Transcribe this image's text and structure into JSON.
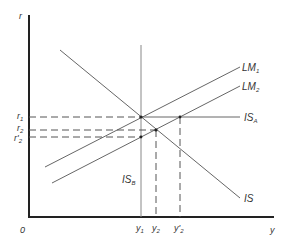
{
  "diagram": {
    "type": "IS-LM",
    "axes": {
      "y_label": "r",
      "x_label": "y",
      "origin_label": "0"
    },
    "curves": [
      {
        "id": "LM1",
        "label": "LM",
        "sub": "1"
      },
      {
        "id": "LM2",
        "label": "LM",
        "sub": "2"
      },
      {
        "id": "ISA",
        "label": "IS",
        "sub": "A"
      },
      {
        "id": "ISB",
        "label": "IS",
        "sub": "B"
      },
      {
        "id": "IS",
        "label": "IS",
        "sub": ""
      }
    ],
    "y_ticks": [
      {
        "label": "r",
        "sub": "1"
      },
      {
        "label": "r",
        "sub": "2"
      },
      {
        "label": "r'",
        "sub": "2"
      }
    ],
    "x_ticks": [
      {
        "label": "y",
        "sub": "1"
      },
      {
        "label": "y",
        "sub": "2"
      },
      {
        "label": "y'",
        "sub": "2"
      }
    ],
    "colors": {
      "axis": "#222222",
      "line": "#666666",
      "dash": "#555555"
    }
  }
}
